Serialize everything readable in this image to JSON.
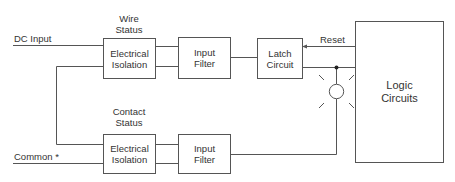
{
  "diagram": {
    "type": "block-diagram",
    "line_color": "#555555",
    "inputs": {
      "dc_input": "DC Input",
      "common": "Common *"
    },
    "labels": {
      "wire_status_line1": "Wire",
      "wire_status_line2": "Status",
      "contact_status_line1": "Contact",
      "contact_status_line2": "Status",
      "reset": "Reset"
    },
    "blocks": {
      "top_isolation": {
        "line1": "Electrical",
        "line2": "Isolation"
      },
      "top_filter": {
        "line1": "Input",
        "line2": "Filter"
      },
      "latch": {
        "line1": "Latch",
        "line2": "Circuit"
      },
      "bottom_isolation": {
        "line1": "Electrical",
        "line2": "Isolation"
      },
      "bottom_filter": {
        "line1": "Input",
        "line2": "Filter"
      },
      "logic": {
        "line1": "Logic",
        "line2": "Circuits"
      }
    },
    "indicator": "led-indicator"
  }
}
